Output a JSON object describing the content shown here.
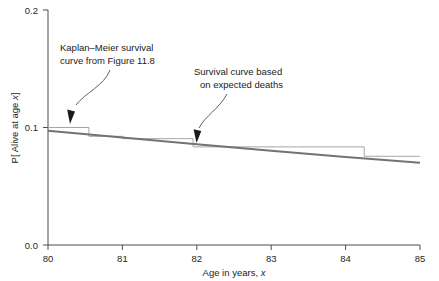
{
  "chart_data": {
    "type": "line",
    "title": "",
    "xlabel": "Age in years, x",
    "ylabel": "P[ Alive at age x]",
    "xlim": [
      80,
      85
    ],
    "ylim": [
      0.0,
      0.2
    ],
    "grid": false,
    "legend_position": "none",
    "xticks": [
      "80",
      "81",
      "82",
      "83",
      "84",
      "85"
    ],
    "xtick_values": [
      80,
      81,
      82,
      83,
      84,
      85
    ],
    "yticks": [
      "0.0",
      "0.1",
      "0.2"
    ],
    "ytick_values": [
      0.0,
      0.1,
      0.2
    ],
    "series": [
      {
        "name": "Kaplan-Meier survival curve from Figure 11.8",
        "type": "step",
        "color": "#a6a6a6",
        "x": [
          80.0,
          80.55,
          80.55,
          81.0,
          81.0,
          81.95,
          81.95,
          84.25,
          84.25,
          85.0
        ],
        "y": [
          0.1,
          0.1,
          0.0925,
          0.0925,
          0.0905,
          0.0905,
          0.0835,
          0.0835,
          0.0755,
          0.0755
        ]
      },
      {
        "name": "Survival curve based on expected deaths",
        "type": "line",
        "color": "#737373",
        "x": [
          80.0,
          81.0,
          82.0,
          83.0,
          84.0,
          85.0
        ],
        "y": [
          0.0972,
          0.0915,
          0.0858,
          0.0802,
          0.0748,
          0.07
        ]
      }
    ],
    "annotations": [
      {
        "text_line1": "Kaplan–Meier survival",
        "text_line2": "curve from Figure 11.8",
        "points_to_x": 80.3,
        "points_to_y": 0.1
      },
      {
        "text_line1": "Survival curve based",
        "text_line2": "on expected deaths",
        "points_to_x": 82.0,
        "points_to_y": 0.0858
      }
    ]
  },
  "axes": {
    "ylabel": "P[ Alive at age x]",
    "ylabel_prefix": "P[ Alive at age ",
    "ylabel_italic": "x",
    "ylabel_suffix": "]",
    "xlabel_prefix": "Age in years, ",
    "xlabel_italic": "x",
    "ytick_0": "0.0",
    "ytick_1": "0.1",
    "ytick_2": "0.2",
    "xtick_0": "80",
    "xtick_1": "81",
    "xtick_2": "82",
    "xtick_3": "83",
    "xtick_4": "84",
    "xtick_5": "85"
  },
  "annotations": {
    "km": {
      "line1": "Kaplan–Meier survival",
      "line2": "curve from Figure 11.8"
    },
    "expected": {
      "line1": "Survival curve based",
      "line2": "on expected deaths"
    }
  },
  "colors": {
    "km_curve": "#a6a6a6",
    "expected_curve": "#737373",
    "axis": "#4d4d4d",
    "text": "#1a1a1a",
    "background": "#ffffff"
  }
}
